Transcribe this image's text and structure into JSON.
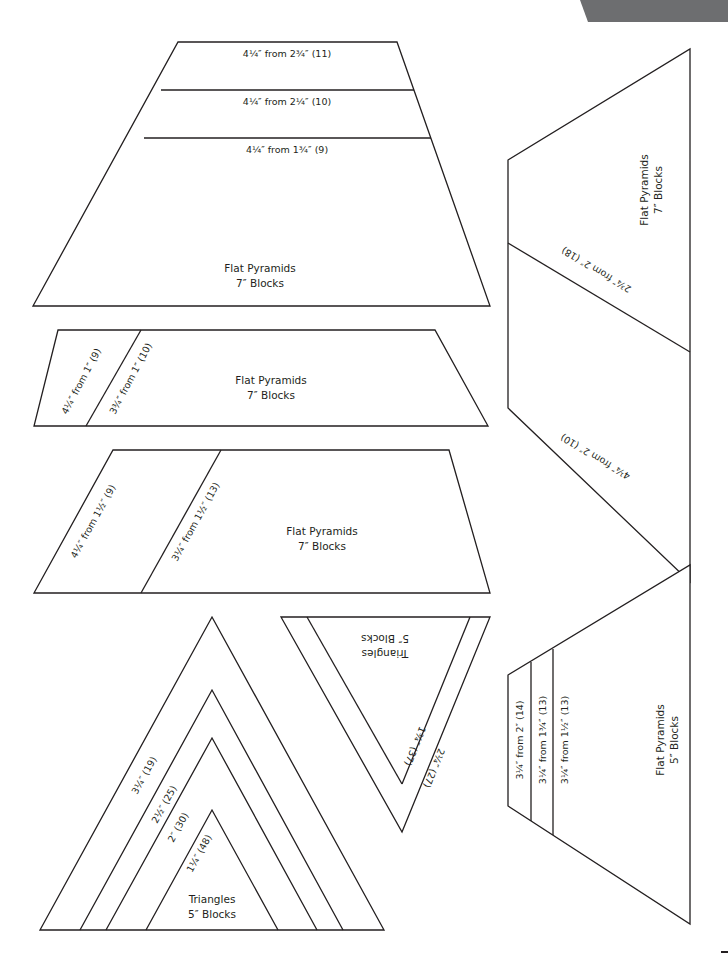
{
  "page": {
    "corner_tab_color": "#6d6e70",
    "line_color": "#231f20"
  },
  "flat_pyramid_7_a": {
    "title": "Flat Pyramids",
    "subtitle": "7″ Blocks",
    "rows": [
      "4¼″ from 2¾″ (11)",
      "4¼″ from 2¼″ (10)",
      "4¼″ from 1¾″ (9)"
    ]
  },
  "flat_pyramid_7_b": {
    "title": "Flat Pyramids",
    "subtitle": "7″ Blocks",
    "strips": [
      "4¼″ from 1″ (9)",
      "3¾″ from 1″ (10)"
    ]
  },
  "flat_pyramid_7_c": {
    "title": "Flat Pyramids",
    "subtitle": "7″ Blocks",
    "strips": [
      "4¼″ from 1½″ (9)",
      "3¼″ from 1½″ (13)"
    ]
  },
  "flat_pyramid_7_d": {
    "title": "Flat Pyramids",
    "subtitle": "7″ Blocks",
    "strips": [
      "2¾″ from 2″ (18)",
      "4¼″ from 2″ (10)"
    ]
  },
  "triangles_5_inverted": {
    "title": "Triangles",
    "subtitle": "5″ Blocks",
    "strips": [
      "1¾″ (37)",
      "2¼″ (27)"
    ]
  },
  "triangles_5_upright": {
    "title": "Triangles",
    "subtitle": "5″ Blocks",
    "strips": [
      "3¼″ (19)",
      "2½″ (25)",
      "2″ (30)",
      "1¼″ (48)"
    ]
  },
  "flat_pyramid_5": {
    "title": "Flat Pyramids",
    "subtitle": "5″ Blocks",
    "strips": [
      "3¼″ from 2″ (14)",
      "3¼″ from 1¾″ (13)",
      "3¼″ from 1½″ (13)"
    ]
  }
}
